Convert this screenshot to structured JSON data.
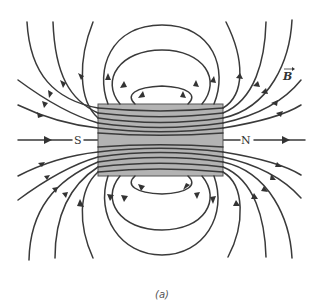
{
  "figure": {
    "caption": "(a)",
    "field_label": "B",
    "magnet": {
      "south_label": "S",
      "north_label": "N",
      "fill": "#b3b3b3",
      "rect": {
        "x": 98,
        "y": 104,
        "w": 125,
        "h": 72
      }
    },
    "line_color": "#3a3a3a"
  }
}
